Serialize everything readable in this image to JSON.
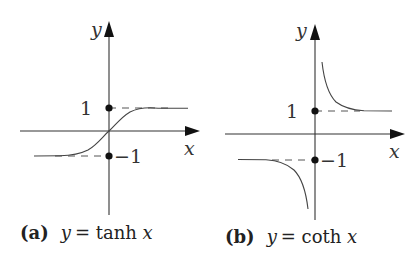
{
  "figure": {
    "panels": [
      {
        "id": "a",
        "caption_tag": "(a)",
        "caption_var": "y",
        "caption_eq": " = tanh ",
        "caption_arg": "x",
        "function": "tanh",
        "x_axis_label": "x",
        "y_axis_label": "y",
        "marks": [
          {
            "value": 1,
            "label": "1"
          },
          {
            "value": -1,
            "label": "−1"
          }
        ],
        "asymptotes": [
          1,
          -1
        ]
      },
      {
        "id": "b",
        "caption_tag": "(b)",
        "caption_var": "y",
        "caption_eq": " = coth ",
        "caption_arg": "x",
        "function": "coth",
        "x_axis_label": "x",
        "y_axis_label": "y",
        "marks": [
          {
            "value": 1,
            "label": "1"
          },
          {
            "value": -1,
            "label": "−1"
          }
        ],
        "asymptotes": [
          1,
          -1
        ]
      }
    ]
  }
}
